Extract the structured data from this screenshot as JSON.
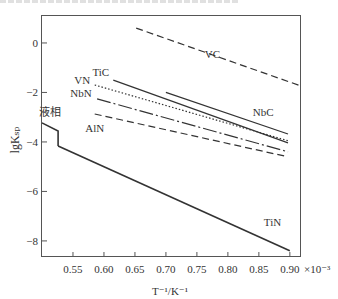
{
  "chart_data": {
    "type": "line",
    "title": "",
    "xlabel": "T^-1/K^-1",
    "x_multiplier": "×10^-3",
    "ylabel": "lgK_sp",
    "xlim": [
      0.5,
      0.918
    ],
    "ylim": [
      -8.65,
      1.13
    ],
    "xticks": [
      0.55,
      0.6,
      0.65,
      0.7,
      0.75,
      0.8,
      0.85,
      0.9
    ],
    "xtick_labels": [
      "0.55",
      "0.60",
      "0.65",
      "0.70",
      "0.75",
      "0.80",
      "0.85",
      "0.90"
    ],
    "yticks": [
      0,
      -2,
      -4,
      -6,
      -8
    ],
    "ytick_labels": [
      "0",
      "−2",
      "−4",
      "−6",
      "−8"
    ],
    "grid": false,
    "legend": "inline labels",
    "series": [
      {
        "name": "VC",
        "style": "dashed",
        "x": [
          0.652,
          0.918
        ],
        "y": [
          0.6,
          -1.74
        ],
        "label_pos": [
          0.775,
          -0.6
        ]
      },
      {
        "name": "TiC",
        "style": "solid",
        "x": [
          0.615,
          0.897
        ],
        "y": [
          -1.5,
          -4.04
        ],
        "label_pos": [
          0.595,
          -1.35
        ]
      },
      {
        "name": "NbC",
        "style": "solid",
        "x": [
          0.7,
          0.897
        ],
        "y": [
          -2.0,
          -3.68
        ],
        "label_pos": [
          0.857,
          -2.95
        ]
      },
      {
        "name": "VN",
        "style": "dotted",
        "x": [
          0.585,
          0.897
        ],
        "y": [
          -1.7,
          -3.95
        ],
        "label_pos": [
          0.565,
          -1.65
        ]
      },
      {
        "name": "NbN",
        "style": "dashdot",
        "x": [
          0.589,
          0.897
        ],
        "y": [
          -2.26,
          -4.4
        ],
        "label_pos": [
          0.563,
          -2.2
        ]
      },
      {
        "name": "AlN",
        "style": "dashed",
        "x": [
          0.585,
          0.897
        ],
        "y": [
          -2.87,
          -4.6
        ],
        "label_pos": [
          0.585,
          -3.6
        ]
      },
      {
        "name": "液相",
        "style": "solid-bold",
        "x": [
          0.5,
          0.526,
          0.526
        ],
        "y": [
          -3.23,
          -3.56,
          -4.16
        ],
        "label_pos": [
          0.513,
          -2.95
        ]
      },
      {
        "name": "TiN",
        "style": "solid-bold",
        "x": [
          0.526,
          0.9
        ],
        "y": [
          -4.16,
          -8.4
        ],
        "label_pos": [
          0.872,
          -7.4
        ]
      }
    ]
  }
}
